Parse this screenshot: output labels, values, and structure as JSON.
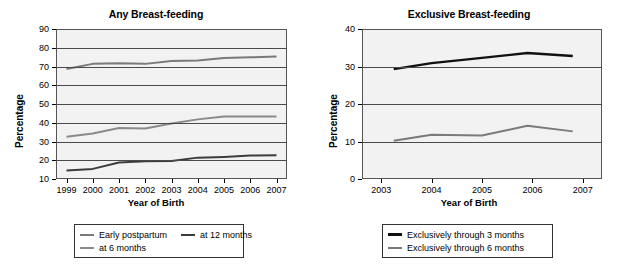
{
  "figure": {
    "background": "#ffffff",
    "plot_background": "#f2f2f2",
    "grid_color": "#4a4a4a",
    "axis_color": "#555555"
  },
  "panels": [
    {
      "title": "Any Breast-feeding",
      "xlabel": "Year of Birth",
      "ylabel": "Percentage"
    },
    {
      "title": "Exclusive Breast-feeding",
      "xlabel": "Year of Birth",
      "ylabel": "Percentage"
    }
  ],
  "legends": [
    {
      "rows": [
        [
          {
            "label": "Early postpartum",
            "color": "#7a7a7a"
          },
          {
            "label": "at 12 months",
            "color": "#3c3c3c"
          }
        ],
        [
          {
            "label": "at 6 months",
            "color": "#8a8a8a"
          }
        ]
      ]
    },
    {
      "rows": [
        [
          {
            "label": "Exclusively through 3 months",
            "color": "#111111"
          }
        ],
        [
          {
            "label": "Exclusively through 6 months",
            "color": "#7a7a7a"
          }
        ]
      ]
    }
  ],
  "chart_data": [
    {
      "type": "line",
      "title": "Any Breast-feeding",
      "xlabel": "Year of Birth",
      "ylabel": "Percentage",
      "x": [
        1999,
        2000,
        2001,
        2002,
        2003,
        2004,
        2005,
        2006,
        2007
      ],
      "xticklabels": [
        "1999",
        "2000",
        "2001",
        "2002",
        "2003",
        "2004",
        "2005",
        "2006",
        "2007"
      ],
      "xlim": [
        1998.6,
        2007.4
      ],
      "ylim": [
        10,
        90
      ],
      "yticks": [
        10,
        20,
        30,
        40,
        50,
        60,
        70,
        80,
        90
      ],
      "yticklabels": [
        "10",
        "20",
        "30",
        "40",
        "50",
        "60",
        "70",
        "80",
        "90"
      ],
      "grid": true,
      "legend_position": "below",
      "series": [
        {
          "name": "Early postpartum",
          "color": "#7a7a7a",
          "width": 2.0,
          "values": [
            68.7,
            71.4,
            71.8,
            71.4,
            72.9,
            73.2,
            74.6,
            74.9,
            75.3
          ]
        },
        {
          "name": "at 6 months",
          "color": "#8a8a8a",
          "width": 2.0,
          "values": [
            32.5,
            34.3,
            37.2,
            36.9,
            39.6,
            41.8,
            43.3,
            43.3,
            43.3
          ]
        },
        {
          "name": "at 12 months",
          "color": "#3c3c3c",
          "width": 2.0,
          "values": [
            14.5,
            15.4,
            18.8,
            19.5,
            19.6,
            21.4,
            21.8,
            22.5,
            22.7
          ]
        }
      ]
    },
    {
      "type": "line",
      "title": "Exclusive Breast-feeding",
      "xlabel": "Year of Birth",
      "ylabel": "Percentage",
      "x": [
        2003.25,
        2004.0,
        2005.0,
        2005.9,
        2006.8
      ],
      "xticks": [
        2003,
        2004,
        2005,
        2006,
        2007
      ],
      "xticklabels": [
        "2003",
        "2004",
        "2005",
        "2006",
        "2007"
      ],
      "xlim": [
        2002.62,
        2007.38
      ],
      "ylim": [
        0,
        40
      ],
      "yticks": [
        0,
        10,
        20,
        30,
        40
      ],
      "yticklabels": [
        "0",
        "10",
        "20",
        "30",
        "40"
      ],
      "grid": true,
      "legend_position": "below",
      "series": [
        {
          "name": "Exclusively through 3 months",
          "color": "#111111",
          "width": 2.4,
          "values": [
            29.3,
            30.9,
            32.3,
            33.6,
            32.8
          ]
        },
        {
          "name": "Exclusively through 6 months",
          "color": "#7a7a7a",
          "width": 2.0,
          "values": [
            10.2,
            11.8,
            11.6,
            14.2,
            12.7
          ]
        }
      ]
    }
  ]
}
